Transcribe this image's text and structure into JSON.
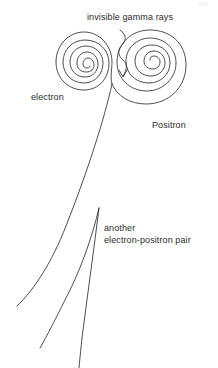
{
  "figure": {
    "background_color": "#ffffff",
    "stroke_color": "#3a3a3a",
    "text_color": "#2b2b2b",
    "width": 218,
    "height": 368
  },
  "page_number": "241",
  "labels": {
    "gamma": "invisible gamma rays",
    "electron": "electron",
    "positron": "Positron",
    "another_pair_line1": "another",
    "another_pair_line2": "electron-positron pair"
  },
  "diagram": {
    "elements": [
      {
        "name": "electron-spiral",
        "type": "spiral",
        "center_x": 84,
        "center_y": 62,
        "start_radius": 30,
        "end_radius": 3,
        "turns": 2.6,
        "direction": "counterclockwise"
      },
      {
        "name": "positron-spiral",
        "type": "spiral",
        "center_x": 170,
        "center_y": 63,
        "start_radius": 40,
        "end_radius": 3,
        "turns": 2.7,
        "direction": "clockwise"
      },
      {
        "name": "gamma-ray-squiggle",
        "type": "wavy-arrow",
        "from_x": 122,
        "from_y": 30,
        "to_x": 123,
        "to_y": 76,
        "arrowhead": "down"
      },
      {
        "name": "pair-production-vertex",
        "type": "vertex",
        "x": 112,
        "y": 84
      },
      {
        "name": "primary-track",
        "type": "curved-track",
        "from_x": 112,
        "from_y": 84,
        "to_x": 17,
        "to_y": 306
      },
      {
        "name": "secondary-pair-vertex",
        "type": "vertex",
        "x": 99,
        "y": 208
      },
      {
        "name": "secondary-track-left",
        "type": "curved-track",
        "from_x": 99,
        "from_y": 208,
        "to_x": 40,
        "to_y": 348
      },
      {
        "name": "secondary-track-right",
        "type": "curved-track",
        "from_x": 99,
        "from_y": 208,
        "to_x": 79,
        "to_y": 368
      }
    ]
  }
}
